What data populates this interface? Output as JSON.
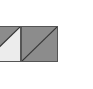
{
  "tiles": [
    {
      "id": "tile-a",
      "state": "half-filled",
      "upper_color": "#8c8c8c",
      "lower_color": "#ececec",
      "border_color": "#555555"
    },
    {
      "id": "tile-b",
      "state": "filled",
      "upper_color": "#8c8c8c",
      "lower_color": "#8c8c8c",
      "border_color": "#555555"
    }
  ],
  "colors": {
    "diagonal": "#333333",
    "background": "#ffffff"
  }
}
